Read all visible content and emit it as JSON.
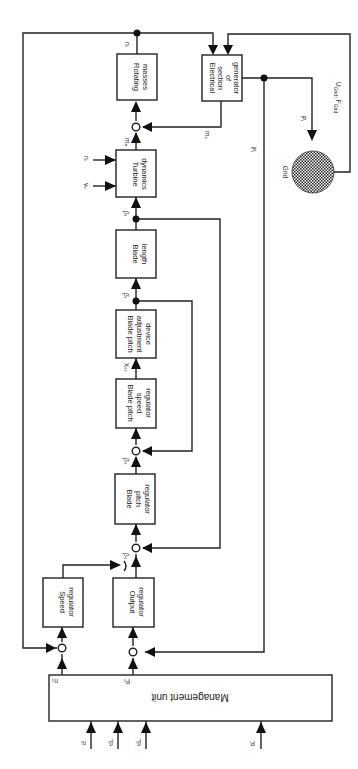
{
  "diagram": {
    "blocks": {
      "rotating_masses": [
        "Rotating",
        "masses"
      ],
      "electrical_section": [
        "Electrical",
        "section",
        "of",
        "generator"
      ],
      "turbine_dynamics": [
        "Turbine",
        "dynamics"
      ],
      "blade_length": [
        "Blade",
        "length"
      ],
      "blade_pitch_adjustment": [
        "Blade pitch",
        "adjustment",
        "device"
      ],
      "blade_pitch_speed_regulator": [
        "Blade pitch",
        "speed",
        "regulator"
      ],
      "blade_pitch_regulator": [
        "Blade",
        "pitch",
        "regulator"
      ],
      "speed_regulator": [
        "Speed",
        "regulator"
      ],
      "output_regulator": [
        "Output",
        "regulator"
      ],
      "management_unit": "Management unit",
      "grid": "Grid"
    },
    "signals": {
      "n_r": "nᵣ",
      "m_a": "mₐ",
      "m_e": "mₑ",
      "n_r_in": "nᵣ",
      "v_w": "vᵥ",
      "beta": "βᵢ",
      "beta_dot": "β̇ᵢ",
      "x_st": "Xₛₜ",
      "beta_dot_s": "β̇ₛ",
      "beta_s": "βₛ",
      "p_i": "Pᵢ",
      "p_i_line": "Pᵢ",
      "u_grid": "U",
      "u_grid_sub": "Grid",
      "f_grid": ", F",
      "f_grid_sub": "Grid",
      "n_s": "nₛ",
      "p_s": "Pₛ",
      "mu_in_n": "nᵣ",
      "mu_in_beta": "βᵢ",
      "mu_in_beta_dot": "β̇ᵢ",
      "mu_in_p": "Pᵢ"
    }
  }
}
